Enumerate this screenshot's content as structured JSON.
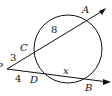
{
  "diagram": {
    "type": "secant-secant",
    "points": {
      "P": {
        "label": "P",
        "x": 3,
        "y": 66
      },
      "A": {
        "label": "A",
        "x": 86,
        "y": 17
      },
      "B": {
        "label": "B",
        "x": 87,
        "y": 81
      },
      "C": {
        "label": "C",
        "x": 23,
        "y": 49
      },
      "D": {
        "label": "D",
        "x": 34,
        "y": 80
      }
    },
    "circle": {
      "cx": 68,
      "cy": 49,
      "r": 34
    },
    "segments": {
      "PC": "3",
      "CA": "8",
      "PD": "4",
      "DB": "x"
    },
    "stroke_color": "#111111"
  }
}
